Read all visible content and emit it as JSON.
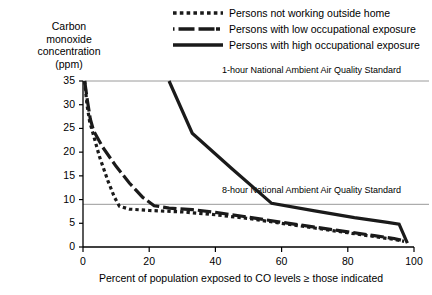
{
  "chart_data": {
    "type": "line",
    "title": "",
    "ylabel": "Carbon\nmonoxide\nconcentration\n(ppm)",
    "xlabel": "Percent of population exposed to CO levels ≥ those indicated",
    "xlim": [
      0,
      100
    ],
    "ylim": [
      0,
      35
    ],
    "xticks": [
      0,
      20,
      40,
      60,
      80,
      100
    ],
    "yticks": [
      0,
      5,
      10,
      15,
      20,
      25,
      30,
      35
    ],
    "grid": false,
    "legend_position": "top-right",
    "series": [
      {
        "name": "Persons not working outside home",
        "style": "dotted",
        "color": "#1a1a1a",
        "points": [
          [
            0.5,
            35
          ],
          [
            1.2,
            30
          ],
          [
            2.0,
            26.5
          ],
          [
            3.0,
            24
          ],
          [
            5.0,
            19
          ],
          [
            7.5,
            14
          ],
          [
            9.5,
            10.5
          ],
          [
            11.0,
            8.6
          ],
          [
            14.0,
            8.0
          ],
          [
            20.0,
            7.7
          ],
          [
            30.0,
            7.4
          ],
          [
            40.0,
            6.8
          ],
          [
            50.0,
            6.0
          ],
          [
            60.0,
            5.0
          ],
          [
            70.0,
            4.0
          ],
          [
            80.0,
            3.0
          ],
          [
            88.0,
            2.2
          ],
          [
            94.0,
            1.6
          ],
          [
            97.0,
            1.2
          ]
        ]
      },
      {
        "name": "Persons with low occupational exposure",
        "style": "dashed",
        "color": "#1a1a1a",
        "points": [
          [
            0.5,
            35
          ],
          [
            1.3,
            31
          ],
          [
            2.2,
            27
          ],
          [
            3.2,
            24.5
          ],
          [
            6.0,
            21
          ],
          [
            10.0,
            17
          ],
          [
            14.0,
            13.5
          ],
          [
            18.0,
            10.5
          ],
          [
            21.5,
            8.7
          ],
          [
            26.0,
            8.2
          ],
          [
            33.0,
            7.9
          ],
          [
            40.0,
            7.3
          ],
          [
            50.0,
            6.3
          ],
          [
            60.0,
            5.2
          ],
          [
            70.0,
            4.2
          ],
          [
            80.0,
            3.2
          ],
          [
            88.0,
            2.4
          ],
          [
            94.0,
            1.8
          ],
          [
            97.0,
            1.3
          ]
        ]
      },
      {
        "name": "Persons with high occupational exposure",
        "style": "solid",
        "color": "#1a1a1a",
        "points": [
          [
            26.0,
            35
          ],
          [
            33.0,
            24
          ],
          [
            45.0,
            16.5
          ],
          [
            57.0,
            9.2
          ],
          [
            70.0,
            7.6
          ],
          [
            82.0,
            6.2
          ],
          [
            92.0,
            5.2
          ],
          [
            95.5,
            4.8
          ],
          [
            98.0,
            0.8
          ]
        ]
      }
    ],
    "reference_lines": [
      {
        "label": "1-hour National Ambient Air Quality Standard",
        "value": 35
      },
      {
        "label": "8-hour National Ambient Air Quality Standard",
        "value": 9
      }
    ]
  },
  "legend": {
    "items": [
      {
        "label": "Persons not working outside home",
        "style": "dotted"
      },
      {
        "label": "Persons with low occupational exposure",
        "style": "dashed"
      },
      {
        "label": "Persons with high occupational exposure",
        "style": "solid"
      }
    ]
  },
  "axes": {
    "y_title": "Carbon\nmonoxide\nconcentration\n(ppm)",
    "x_title": "Percent of population exposed to CO levels ≥ those indicated",
    "y_tick_labels": [
      "35",
      "30",
      "25",
      "20",
      "15",
      "10",
      "5",
      "0"
    ],
    "x_tick_labels": [
      "0",
      "20",
      "40",
      "60",
      "80",
      "100"
    ]
  },
  "annotations": {
    "std_1hour": "1-hour National Ambient Air Quality Standard",
    "std_8hour": "8-hour National Ambient Air Quality Standard"
  },
  "colors": {
    "line": "#1a1a1a",
    "axis": "#000000",
    "reference": "#9a9a9a",
    "background": "#ffffff"
  }
}
